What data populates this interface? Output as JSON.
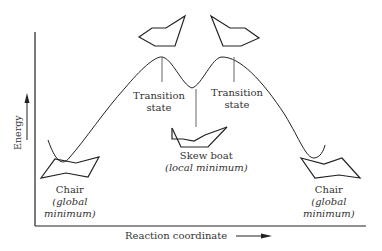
{
  "axes": {
    "xlabel": "Reaction coordinate",
    "ylabel": "Energy"
  },
  "annotations": {
    "ts_left": [
      "Transition",
      "state"
    ],
    "ts_right": [
      "Transition",
      "state"
    ],
    "skew": [
      "Skew boat",
      "(local minimum)"
    ],
    "chair_left": [
      "Chair",
      "(global",
      "minimum)"
    ],
    "chair_right": [
      "Chair",
      "(global",
      "minimum)"
    ]
  },
  "colors": {
    "line": "#222222",
    "text": "#333333",
    "leader": "#666666"
  }
}
